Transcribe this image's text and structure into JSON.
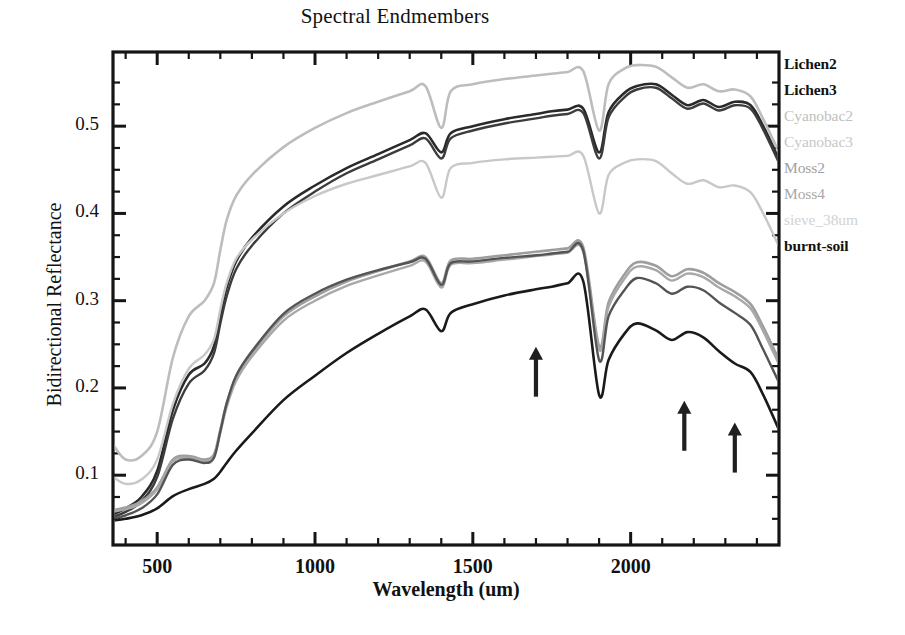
{
  "chart_data": {
    "type": "line",
    "title": "Spectral Endmembers",
    "xlabel": "Wavelength (um)",
    "ylabel": "Bidirectional Reflectance",
    "xlim": [
      360,
      2470
    ],
    "ylim": [
      0.02,
      0.585
    ],
    "xticks": [
      500,
      1000,
      1500,
      2000
    ],
    "yticks": [
      0.1,
      0.2,
      0.3,
      0.4,
      0.5
    ],
    "xtick_labels": [
      "500",
      "1000",
      "1500",
      "2000"
    ],
    "ytick_labels": [
      "0.1",
      "0.2",
      "0.3",
      "0.4",
      "0.5"
    ],
    "grid": false,
    "legend_position": "right-outside",
    "x": [
      360,
      400,
      450,
      500,
      550,
      600,
      650,
      680,
      700,
      720,
      750,
      800,
      900,
      1000,
      1100,
      1200,
      1300,
      1350,
      1400,
      1430,
      1500,
      1600,
      1700,
      1750,
      1800,
      1850,
      1900,
      1930,
      1980,
      2020,
      2080,
      2130,
      2180,
      2230,
      2280,
      2330,
      2380,
      2420,
      2470
    ],
    "series": [
      {
        "name": "Lichen2",
        "color": "#2a2a2a",
        "width": 2.6,
        "values": [
          0.055,
          0.062,
          0.075,
          0.105,
          0.175,
          0.215,
          0.228,
          0.248,
          0.283,
          0.315,
          0.345,
          0.372,
          0.408,
          0.432,
          0.452,
          0.468,
          0.484,
          0.492,
          0.47,
          0.492,
          0.5,
          0.508,
          0.514,
          0.517,
          0.519,
          0.52,
          0.47,
          0.516,
          0.538,
          0.546,
          0.548,
          0.536,
          0.524,
          0.53,
          0.522,
          0.528,
          0.524,
          0.5,
          0.462
        ]
      },
      {
        "name": "Lichen3",
        "color": "#3c3c3c",
        "width": 2.4,
        "values": [
          0.052,
          0.058,
          0.07,
          0.098,
          0.165,
          0.205,
          0.22,
          0.24,
          0.274,
          0.305,
          0.336,
          0.363,
          0.4,
          0.425,
          0.446,
          0.462,
          0.478,
          0.486,
          0.463,
          0.486,
          0.495,
          0.503,
          0.509,
          0.512,
          0.514,
          0.515,
          0.463,
          0.51,
          0.533,
          0.542,
          0.544,
          0.532,
          0.52,
          0.526,
          0.518,
          0.524,
          0.52,
          0.496,
          0.458
        ]
      },
      {
        "name": "Cyanobac2",
        "color": "#bdbdbd",
        "width": 2.6,
        "values": [
          0.135,
          0.118,
          0.122,
          0.15,
          0.235,
          0.282,
          0.3,
          0.32,
          0.358,
          0.392,
          0.42,
          0.444,
          0.476,
          0.498,
          0.515,
          0.528,
          0.54,
          0.546,
          0.498,
          0.54,
          0.548,
          0.554,
          0.558,
          0.56,
          0.562,
          0.563,
          0.495,
          0.548,
          0.566,
          0.57,
          0.568,
          0.556,
          0.544,
          0.548,
          0.54,
          0.542,
          0.534,
          0.508,
          0.47
        ]
      },
      {
        "name": "Cyanobac3",
        "color": "#c8c8c8",
        "width": 2.4,
        "values": [
          0.098,
          0.09,
          0.095,
          0.118,
          0.182,
          0.222,
          0.238,
          0.256,
          0.29,
          0.32,
          0.348,
          0.37,
          0.4,
          0.42,
          0.434,
          0.444,
          0.454,
          0.458,
          0.418,
          0.452,
          0.458,
          0.462,
          0.464,
          0.465,
          0.466,
          0.466,
          0.4,
          0.444,
          0.458,
          0.462,
          0.46,
          0.446,
          0.434,
          0.438,
          0.43,
          0.432,
          0.424,
          0.4,
          0.362
        ]
      },
      {
        "name": "Moss2",
        "color": "#9e9e9e",
        "width": 2.6,
        "values": [
          0.06,
          0.063,
          0.07,
          0.086,
          0.118,
          0.122,
          0.118,
          0.124,
          0.152,
          0.182,
          0.212,
          0.24,
          0.282,
          0.305,
          0.322,
          0.334,
          0.345,
          0.35,
          0.32,
          0.346,
          0.348,
          0.352,
          0.356,
          0.358,
          0.36,
          0.361,
          0.248,
          0.298,
          0.33,
          0.344,
          0.34,
          0.328,
          0.336,
          0.332,
          0.32,
          0.31,
          0.296,
          0.27,
          0.232
        ]
      },
      {
        "name": "Moss4",
        "color": "#a8a8a8",
        "width": 2.4,
        "values": [
          0.058,
          0.061,
          0.068,
          0.084,
          0.116,
          0.12,
          0.116,
          0.122,
          0.149,
          0.178,
          0.208,
          0.236,
          0.277,
          0.3,
          0.317,
          0.329,
          0.34,
          0.345,
          0.315,
          0.341,
          0.343,
          0.347,
          0.351,
          0.353,
          0.355,
          0.356,
          0.244,
          0.293,
          0.325,
          0.339,
          0.335,
          0.323,
          0.331,
          0.327,
          0.315,
          0.305,
          0.291,
          0.265,
          0.227
        ]
      },
      {
        "name": "sieve_38um",
        "color": "#545454",
        "width": 2.4,
        "values": [
          0.05,
          0.054,
          0.062,
          0.078,
          0.112,
          0.118,
          0.114,
          0.12,
          0.15,
          0.182,
          0.214,
          0.242,
          0.285,
          0.308,
          0.324,
          0.335,
          0.344,
          0.348,
          0.318,
          0.343,
          0.345,
          0.349,
          0.352,
          0.354,
          0.356,
          0.357,
          0.232,
          0.282,
          0.312,
          0.326,
          0.32,
          0.308,
          0.316,
          0.312,
          0.298,
          0.286,
          0.272,
          0.244,
          0.206
        ]
      },
      {
        "name": "burnt-soil",
        "color": "#1a1a1a",
        "width": 2.6,
        "values": [
          0.048,
          0.05,
          0.054,
          0.062,
          0.076,
          0.084,
          0.09,
          0.096,
          0.104,
          0.114,
          0.128,
          0.148,
          0.186,
          0.214,
          0.24,
          0.262,
          0.282,
          0.29,
          0.265,
          0.286,
          0.296,
          0.306,
          0.313,
          0.316,
          0.32,
          0.322,
          0.192,
          0.232,
          0.262,
          0.274,
          0.266,
          0.255,
          0.264,
          0.258,
          0.242,
          0.228,
          0.218,
          0.192,
          0.152
        ]
      }
    ],
    "annotations": [
      {
        "type": "arrow-up",
        "x": 1700,
        "y": 0.245,
        "length": 0.055
      },
      {
        "type": "arrow-up",
        "x": 2170,
        "y": 0.183,
        "length": 0.055
      },
      {
        "type": "arrow-up",
        "x": 2330,
        "y": 0.158,
        "length": 0.055
      }
    ]
  },
  "legend": {
    "items": [
      {
        "label": "Lichen2",
        "color": "#1a1a1a",
        "bold": true
      },
      {
        "label": "Lichen3",
        "color": "#1a1a1a",
        "bold": true
      },
      {
        "label": "Cyanobac2",
        "color": "#c0c0c0",
        "bold": false
      },
      {
        "label": "Cyanobac3",
        "color": "#c8c8c8",
        "bold": false
      },
      {
        "label": "Moss2",
        "color": "#a0a0a0",
        "bold": false
      },
      {
        "label": "Moss4",
        "color": "#a8a8a8",
        "bold": false
      },
      {
        "label": "sieve_38um",
        "color": "#d2d2d2",
        "bold": false
      },
      {
        "label": "burnt-soil",
        "color": "#1a1a1a",
        "bold": true
      }
    ]
  }
}
